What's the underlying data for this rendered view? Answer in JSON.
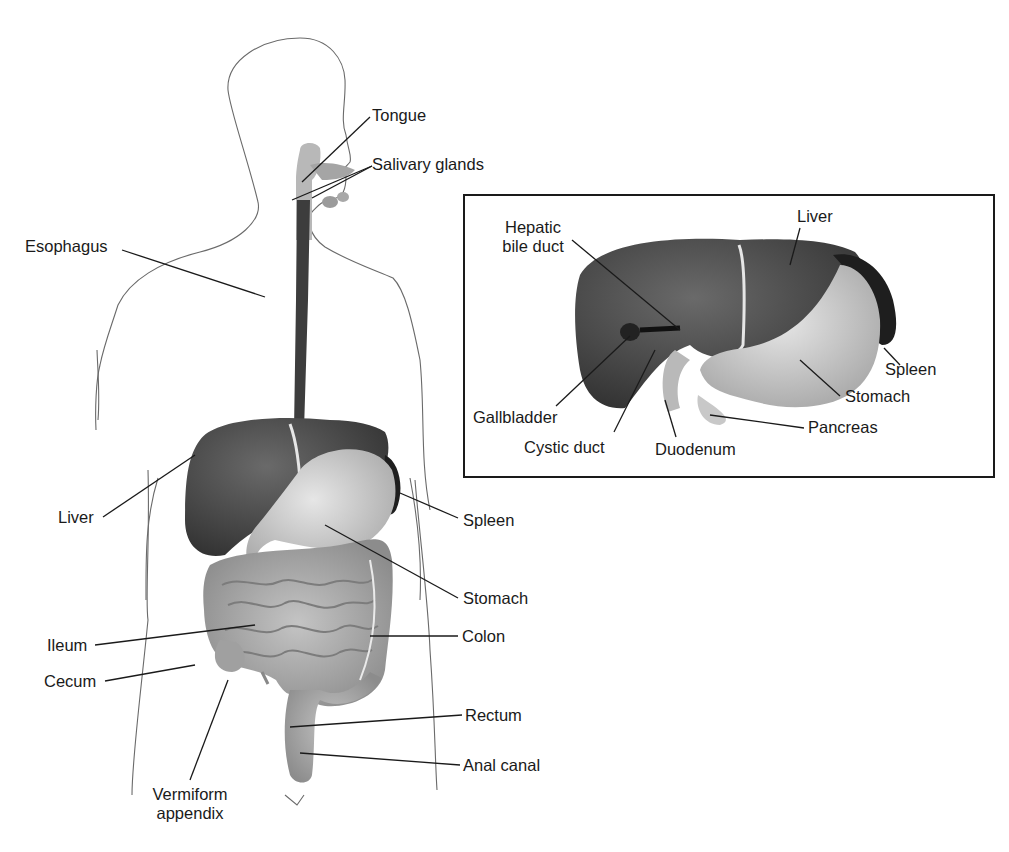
{
  "diagram": {
    "type": "anatomical-illustration",
    "main_labels": {
      "tongue": "Tongue",
      "salivary_glands": "Salivary glands",
      "esophagus": "Esophagus",
      "liver": "Liver",
      "spleen": "Spleen",
      "stomach": "Stomach",
      "ileum": "Ileum",
      "colon": "Colon",
      "cecum": "Cecum",
      "rectum": "Rectum",
      "anal_canal": "Anal canal",
      "vermiform_line1": "Vermiform",
      "vermiform_line2": "appendix"
    },
    "inset": {
      "labels": {
        "hepatic_line1": "Hepatic",
        "hepatic_line2": "bile duct",
        "liver": "Liver",
        "spleen": "Spleen",
        "stomach": "Stomach",
        "gallbladder": "Gallbladder",
        "cystic_duct": "Cystic duct",
        "duodenum": "Duodenum",
        "pancreas": "Pancreas"
      }
    },
    "colors": {
      "outline": "#5a5a5a",
      "liver": "#4a4a4a",
      "stomach": "#cfcfcf",
      "intestine": "#a8a8a8",
      "spleen": "#1e1e1e",
      "leader_line": "#1a1a1a"
    }
  }
}
